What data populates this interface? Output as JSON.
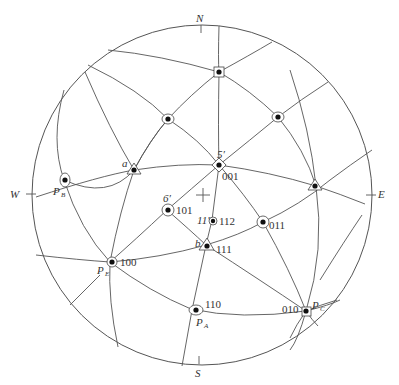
{
  "diagram": {
    "type": "stereographic-projection",
    "directions": {
      "north": "N",
      "south": "S",
      "east": "E",
      "west": "W"
    },
    "poles": [
      {
        "id": "001",
        "index_label": "001",
        "zone_label": "5′",
        "symbol": "quad"
      },
      {
        "id": "101",
        "index_label": "101",
        "zone_label": "6′",
        "symbol": "diad"
      },
      {
        "id": "112",
        "index_label": "112",
        "zone_label": "11′",
        "symbol": "ring"
      },
      {
        "id": "011",
        "index_label": "011",
        "symbol": "diad"
      },
      {
        "id": "111",
        "index_label": "111",
        "zone_label": "b",
        "symbol": "triad"
      },
      {
        "id": "100",
        "index_label": "100",
        "projection_label": "P",
        "projection_sub": "E",
        "symbol": "quad"
      },
      {
        "id": "110",
        "index_label": "110",
        "projection_label": "P",
        "projection_sub": "A",
        "symbol": "diad"
      },
      {
        "id": "010",
        "index_label": "010",
        "projection_label": "P",
        "projection_sub": "C",
        "symbol": "quad"
      },
      {
        "id": "PB",
        "projection_label": "P",
        "projection_sub": "B",
        "symbol": "diad"
      },
      {
        "id": "a",
        "zone_label": "a",
        "symbol": "triad"
      },
      {
        "id": "top",
        "symbol": "quad"
      },
      {
        "id": "upper-left",
        "symbol": "diad"
      },
      {
        "id": "upper-right",
        "symbol": "diad"
      },
      {
        "id": "right",
        "symbol": "triad"
      }
    ],
    "center_mark": "+"
  }
}
